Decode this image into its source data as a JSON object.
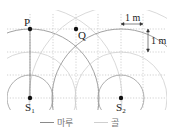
{
  "diagram": {
    "type": "wave-interference",
    "grid_unit": "1 m",
    "points": {
      "P": {
        "label": "P"
      },
      "Q": {
        "label": "Q"
      },
      "S1": {
        "label": "S",
        "sub": "1"
      },
      "S2": {
        "label": "S",
        "sub": "2"
      }
    },
    "scale": {
      "horizontal": "1 m",
      "vertical": "1 m"
    },
    "legend": [
      {
        "key": "crest",
        "label": "마루",
        "color": "#8a8a8a"
      },
      {
        "key": "trough",
        "label": "골",
        "color": "#c8c8c8"
      }
    ]
  }
}
